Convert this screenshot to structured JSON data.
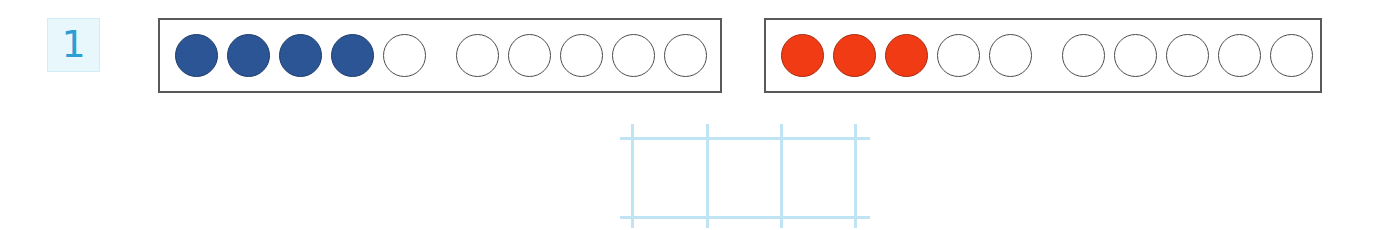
{
  "page": {
    "background_color": "#ffffff",
    "type": "math-worksheet-exercise"
  },
  "exercise": {
    "number": "1",
    "badge_bg_color": "#e8f7fc",
    "badge_border_color": "#cfeef8",
    "number_color": "#2b9ed6"
  },
  "ten_frames": [
    {
      "name": "blue-ten-frame",
      "total_slots": 10,
      "filled_count": 4,
      "empty_count": 6,
      "fill_color": "#2b5595",
      "outline_color": "#4d4d4d",
      "frame_border_color": "#595959",
      "group_break_after": 5,
      "slots": [
        "filled",
        "filled",
        "filled",
        "filled",
        "empty",
        "empty",
        "empty",
        "empty",
        "empty",
        "empty"
      ]
    },
    {
      "name": "red-ten-frame",
      "total_slots": 10,
      "filled_count": 3,
      "empty_count": 7,
      "fill_color": "#f13b14",
      "outline_color": "#4d4d4d",
      "frame_border_color": "#595959",
      "group_break_after": 5,
      "slots": [
        "filled",
        "filled",
        "filled",
        "empty",
        "empty",
        "empty",
        "empty",
        "empty",
        "empty",
        "empty"
      ]
    }
  ],
  "answer_grid": {
    "name": "answer-grid",
    "grid_line_color": "#bfe4f3",
    "columns": 3,
    "rows": 1,
    "vertical_line_count": 4,
    "horizontal_line_count": 2,
    "cell_width": 74,
    "cell_height": 79,
    "cells": [
      "",
      "",
      ""
    ]
  }
}
